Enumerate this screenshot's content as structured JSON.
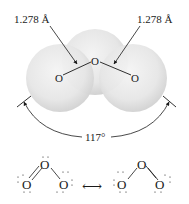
{
  "molecule": {
    "name": "ozone",
    "atoms": [
      "O",
      "O",
      "O"
    ],
    "bond_length_left": "1.278 Å",
    "bond_length_right": "1.278 Å",
    "bond_angle": "117°"
  },
  "space_filling_model": {
    "sphere_color": "#e6e6e6",
    "sphere_shade": "#cfcfcf",
    "atom_labels": {
      "center": "O",
      "left": "O",
      "right": "O"
    }
  },
  "resonance": {
    "arrow": "⟷",
    "structure_1": {
      "top": "O",
      "left": "O",
      "right": "O",
      "double_bond": "left"
    },
    "structure_2": {
      "top": "O",
      "left": "O",
      "right": "O",
      "double_bond": "right"
    }
  }
}
